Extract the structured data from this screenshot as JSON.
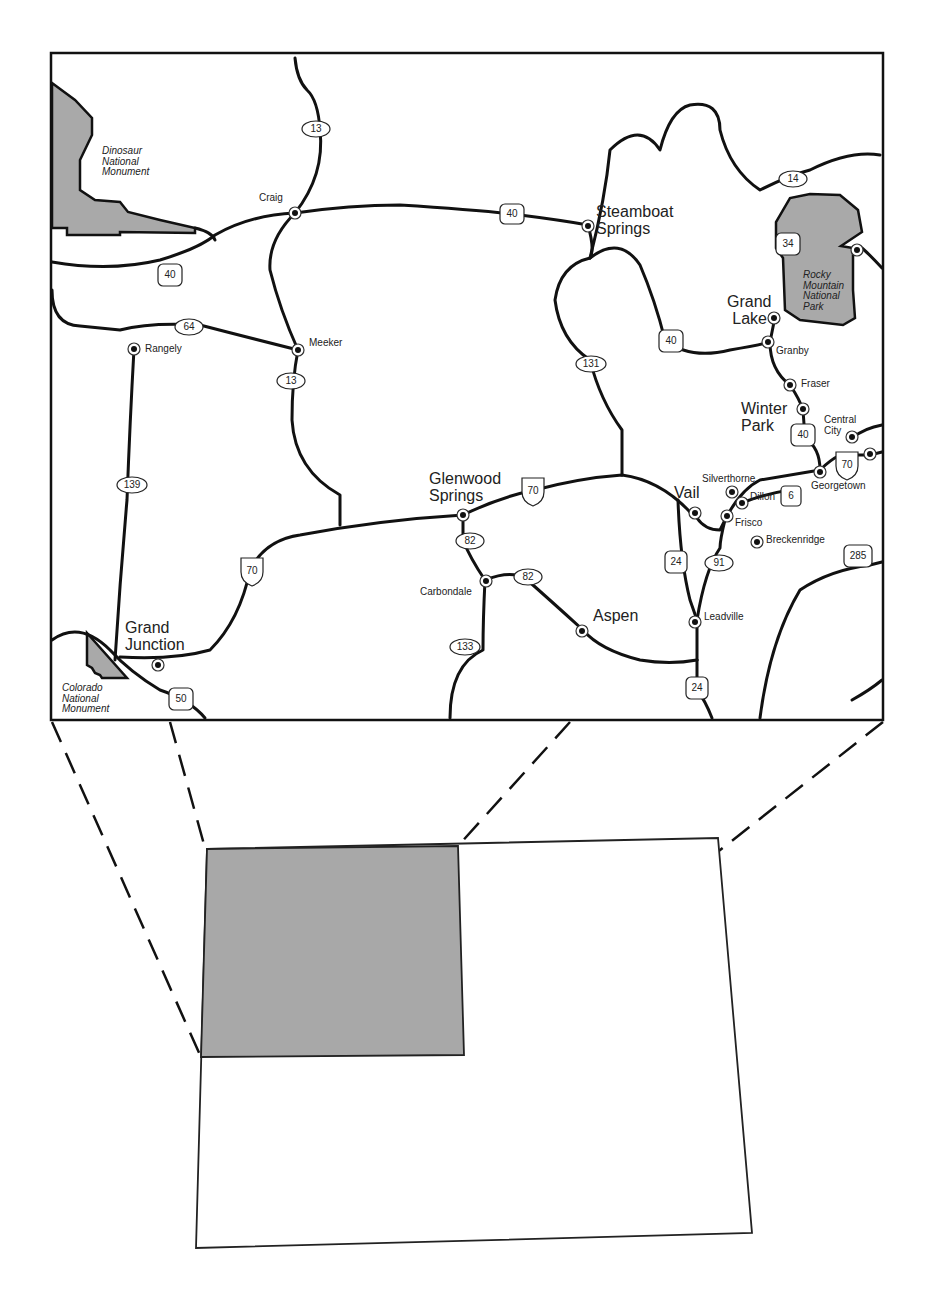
{
  "map": {
    "parks": [
      {
        "name": "Dinosaur National Monument",
        "lines": [
          "Dinosaur",
          "National",
          "Monument"
        ]
      },
      {
        "name": "Rocky Mountain National Park",
        "lines": [
          "Rocky",
          "Mountain",
          "National",
          "Park"
        ]
      },
      {
        "name": "Colorado National Monument",
        "lines": [
          "Colorado",
          "National",
          "Monument"
        ]
      }
    ],
    "towns_large": [
      {
        "lines": [
          "Steamboat",
          "Springs"
        ]
      },
      {
        "lines": [
          "Grand",
          "Lake"
        ]
      },
      {
        "lines": [
          "Winter",
          "Park"
        ]
      },
      {
        "lines": [
          "Glenwood",
          "Springs"
        ]
      },
      {
        "lines": [
          "Vail"
        ]
      },
      {
        "lines": [
          "Aspen"
        ]
      },
      {
        "lines": [
          "Grand",
          "Junction"
        ]
      }
    ],
    "towns_small": [
      "Craig",
      "Rangely",
      "Meeker",
      "Granby",
      "Fraser",
      "Central",
      "City",
      "Silverthorne",
      "Dillon",
      "Georgetown",
      "Frisco",
      "Breckenridge",
      "Carbondale",
      "Leadville"
    ],
    "highways": {
      "state": [
        "13",
        "64",
        "13",
        "139",
        "131",
        "14",
        "82",
        "82",
        "133",
        "91"
      ],
      "us": [
        "40",
        "40",
        "34",
        "40",
        "6",
        "24",
        "24",
        "285",
        "50"
      ],
      "interstate": [
        "70",
        "70",
        "70"
      ]
    }
  },
  "inset": {
    "label": "Colorado state outline with northwest region highlighted",
    "highlight_color": "#a8a8a8"
  }
}
